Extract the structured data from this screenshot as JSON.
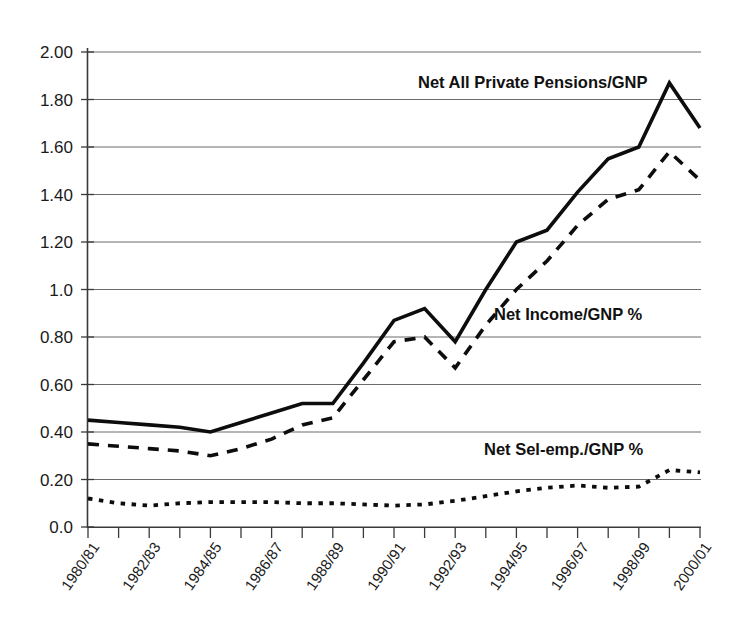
{
  "chart_data": {
    "type": "line",
    "title": "",
    "subtitle": "",
    "xlabel": "",
    "ylabel": "",
    "ylim": [
      0.0,
      2.0
    ],
    "grid": true,
    "legend_position": "inline-annotations",
    "x": [
      "1980/81",
      "1981/82",
      "1982/83",
      "1983/84",
      "1984/85",
      "1985/86",
      "1986/87",
      "1987/88",
      "1988/89",
      "1989/90",
      "1990/91",
      "1991/92",
      "1992/93",
      "1993/94",
      "1994/95",
      "1995/96",
      "1996/97",
      "1997/98",
      "1998/99",
      "1999/00",
      "2000/01"
    ],
    "x_tick_labels_shown": [
      "1980/81",
      "1982/83",
      "1984/85",
      "1986/87",
      "1988/89",
      "1990/91",
      "1992/93",
      "1994/95",
      "1996/97",
      "1998/99",
      "2000/01"
    ],
    "y_tick_labels": [
      "2.00",
      "1.80",
      "1.60",
      "1.40",
      "1.20",
      "1.0",
      "0.80",
      "0.60",
      "0.40",
      "0.20",
      "0.0"
    ],
    "y_tick_values": [
      2.0,
      1.8,
      1.6,
      1.4,
      1.2,
      1.0,
      0.8,
      0.6,
      0.4,
      0.2,
      0.0
    ],
    "series": [
      {
        "name": "Net All Private Pensions/GNP",
        "style": "solid",
        "color": "#0d0d0d",
        "values": [
          0.45,
          0.44,
          0.43,
          0.42,
          0.4,
          0.44,
          0.48,
          0.52,
          0.52,
          0.69,
          0.87,
          0.92,
          0.78,
          1.0,
          1.2,
          1.25,
          1.41,
          1.55,
          1.6,
          1.87,
          1.68
        ]
      },
      {
        "name": "Net Income/GNP %",
        "style": "dashed",
        "color": "#0d0d0d",
        "values": [
          0.35,
          0.34,
          0.33,
          0.32,
          0.3,
          0.33,
          0.37,
          0.43,
          0.46,
          0.62,
          0.78,
          0.8,
          0.67,
          0.85,
          1.0,
          1.12,
          1.27,
          1.38,
          1.42,
          1.58,
          1.46
        ]
      },
      {
        "name": "Net Sel-emp./GNP %",
        "style": "dotted",
        "color": "#0d0d0d",
        "values": [
          0.12,
          0.1,
          0.09,
          0.1,
          0.105,
          0.105,
          0.105,
          0.1,
          0.1,
          0.095,
          0.09,
          0.095,
          0.11,
          0.13,
          0.15,
          0.165,
          0.175,
          0.165,
          0.17,
          0.24,
          0.23
        ]
      }
    ],
    "annotations": [
      {
        "text": "Net All Private Pensions/GNP",
        "series": "Net All Private Pensions/GNP",
        "x": 418,
        "y": 88
      },
      {
        "text": "Net Income/GNP %",
        "series": "Net Income/GNP %",
        "x": 494,
        "y": 320
      },
      {
        "text": "Net Sel-emp./GNP %",
        "series": "Net Sel-emp./GNP %",
        "x": 484,
        "y": 455
      }
    ]
  }
}
